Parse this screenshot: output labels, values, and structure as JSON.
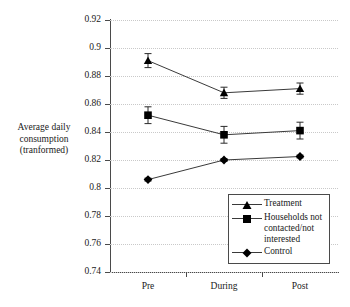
{
  "chart_data": {
    "type": "line",
    "title": "",
    "xlabel": "",
    "ylabel": "Average daily consumption (tranformed)",
    "categories": [
      "Pre",
      "During",
      "Post"
    ],
    "ylim": [
      0.74,
      0.92
    ],
    "ytick_step": 0.02,
    "ytick_labels": [
      "0.92",
      "0.9",
      "0.88",
      "0.86",
      "0.84",
      "0.82",
      "0.8",
      "0.78",
      "0.76",
      "0.74"
    ],
    "ytick_values": [
      0.92,
      0.9,
      0.88,
      0.86,
      0.84,
      0.82,
      0.8,
      0.78,
      0.76,
      0.74
    ],
    "grid": "horizontal-dotted",
    "legend_position": "inside-lower-right",
    "error_bars": true,
    "series": [
      {
        "name": "Treatment",
        "marker": "triangle",
        "color": "#000000",
        "values": [
          0.891,
          0.868,
          0.871
        ],
        "errors": [
          0.005,
          0.004,
          0.004
        ]
      },
      {
        "name": "Households not contacted/not interested",
        "marker": "square",
        "color": "#000000",
        "values": [
          0.852,
          0.838,
          0.841
        ],
        "errors": [
          0.006,
          0.006,
          0.006
        ]
      },
      {
        "name": "Control",
        "marker": "diamond",
        "color": "#000000",
        "values": [
          0.806,
          0.82,
          0.8225
        ],
        "errors": [
          0.001,
          0.001,
          0.001
        ]
      }
    ]
  },
  "y_axis_title": {
    "line1": "Average daily",
    "line2": "consumption",
    "line3": "(tranformed)"
  },
  "legend": {
    "items": [
      {
        "label": "Treatment",
        "marker": "triangle-icon"
      },
      {
        "label": "Households not contacted/not interested",
        "marker": "square-icon"
      },
      {
        "label": "Control",
        "marker": "diamond-icon"
      }
    ]
  }
}
